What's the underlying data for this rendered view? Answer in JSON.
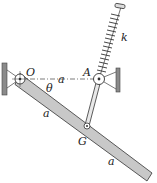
{
  "diagram": {
    "type": "mechanics-linkage",
    "labels": {
      "pivot_O": "O",
      "pivot_A": "A",
      "point_G": "G",
      "angle": "θ",
      "dist_OA": "a",
      "dist_OG": "a",
      "dist_G_end": "a",
      "spring_constant": "k"
    },
    "colors": {
      "bar_fill": "#c8c8c8",
      "outline": "#333333",
      "wall": "#8a8a8a"
    }
  }
}
